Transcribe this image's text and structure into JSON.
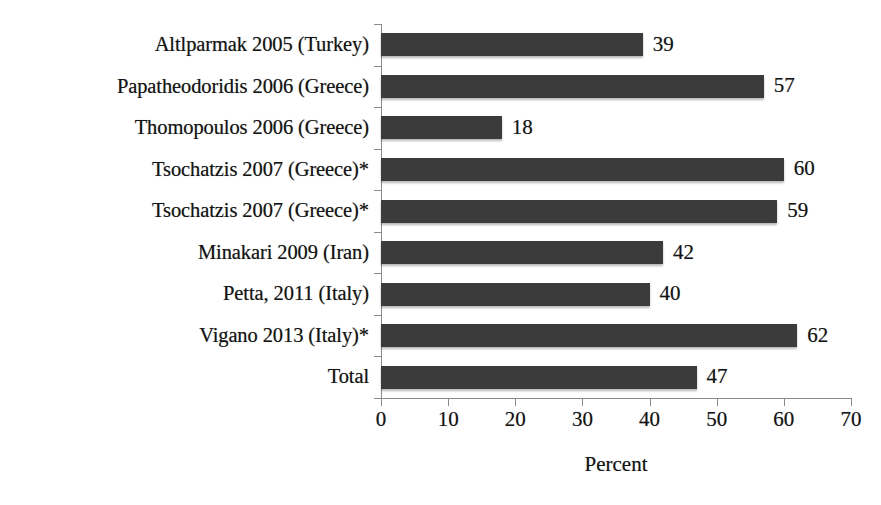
{
  "chart_data": {
    "type": "bar",
    "orientation": "horizontal",
    "title": "",
    "xlabel": "Percent",
    "ylabel": "",
    "xlim": [
      0,
      70
    ],
    "xticks": [
      0,
      10,
      20,
      30,
      40,
      50,
      60,
      70
    ],
    "grid": false,
    "legend": false,
    "bar_color": "#3b3b3b",
    "text_color": "#141414",
    "axis_color": "#8a8a8a",
    "categories": [
      "Altlparmak 2005 (Turkey)",
      "Papatheodoridis 2006 (Greece)",
      "Thomopoulos 2006 (Greece)",
      "Tsochatzis 2007 (Greece)*",
      "Tsochatzis 2007 (Greece)*",
      "Minakari 2009 (Iran)",
      "Petta, 2011 (Italy)",
      "Vigano 2013 (Italy)*",
      "Total"
    ],
    "values": [
      39,
      57,
      18,
      60,
      59,
      42,
      40,
      62,
      47
    ],
    "value_labels": [
      "39",
      "57",
      "18",
      "60",
      "59",
      "42",
      "40",
      "62",
      "47"
    ]
  }
}
